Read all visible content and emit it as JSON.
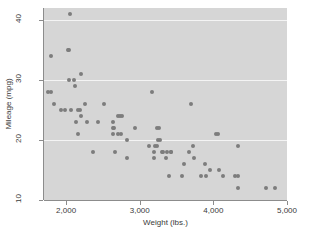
{
  "chart_data": {
    "type": "scatter",
    "title": "",
    "xlabel": "Weight (lbs.)",
    "ylabel": "Mileage (mpg)",
    "xlim": [
      1700,
      5000
    ],
    "ylim": [
      10,
      42
    ],
    "grid": true,
    "legend": null,
    "xticks": [
      {
        "value": 2000,
        "label": "2,000"
      },
      {
        "value": 3000,
        "label": "3,000"
      },
      {
        "value": 4000,
        "label": "4,000"
      },
      {
        "value": 5000,
        "label": "5,000"
      }
    ],
    "yticks": [
      {
        "value": 10,
        "label": "10"
      },
      {
        "value": 20,
        "label": "20"
      },
      {
        "value": 30,
        "label": "30"
      },
      {
        "value": 40,
        "label": "40"
      }
    ],
    "gridlines_y": [
      20,
      30,
      40
    ],
    "marker_color": "#7d7d7d",
    "plot_background": "#d6d6d6",
    "page_background": "#ffffff",
    "points": [
      {
        "x": 2930,
        "y": 22
      },
      {
        "x": 3350,
        "y": 17
      },
      {
        "x": 2640,
        "y": 22
      },
      {
        "x": 3250,
        "y": 20
      },
      {
        "x": 4080,
        "y": 15
      },
      {
        "x": 3670,
        "y": 18
      },
      {
        "x": 3690,
        "y": 26
      },
      {
        "x": 3280,
        "y": 20
      },
      {
        "x": 3880,
        "y": 16
      },
      {
        "x": 4330,
        "y": 19
      },
      {
        "x": 3900,
        "y": 14
      },
      {
        "x": 4290,
        "y": 14
      },
      {
        "x": 4030,
        "y": 21
      },
      {
        "x": 3570,
        "y": 14
      },
      {
        "x": 4130,
        "y": 14
      },
      {
        "x": 4060,
        "y": 21
      },
      {
        "x": 3720,
        "y": 19
      },
      {
        "x": 3420,
        "y": 18
      },
      {
        "x": 3210,
        "y": 19
      },
      {
        "x": 3240,
        "y": 19
      },
      {
        "x": 3130,
        "y": 19
      },
      {
        "x": 3200,
        "y": 18
      },
      {
        "x": 4330,
        "y": 12
      },
      {
        "x": 3370,
        "y": 18
      },
      {
        "x": 4720,
        "y": 12
      },
      {
        "x": 3600,
        "y": 16
      },
      {
        "x": 3740,
        "y": 17
      },
      {
        "x": 3955,
        "y": 15
      },
      {
        "x": 3830,
        "y": 14
      },
      {
        "x": 4840,
        "y": 12
      },
      {
        "x": 4330,
        "y": 14
      },
      {
        "x": 2200,
        "y": 24
      },
      {
        "x": 2520,
        "y": 26
      },
      {
        "x": 2650,
        "y": 22
      },
      {
        "x": 2370,
        "y": 18
      },
      {
        "x": 2750,
        "y": 21
      },
      {
        "x": 2640,
        "y": 21
      },
      {
        "x": 2830,
        "y": 17
      },
      {
        "x": 2710,
        "y": 24
      },
      {
        "x": 2260,
        "y": 26
      },
      {
        "x": 2280,
        "y": 23
      },
      {
        "x": 2120,
        "y": 29
      },
      {
        "x": 2040,
        "y": 35
      },
      {
        "x": 2020,
        "y": 35
      },
      {
        "x": 2050,
        "y": 41
      },
      {
        "x": 1800,
        "y": 34
      },
      {
        "x": 1760,
        "y": 28
      },
      {
        "x": 1800,
        "y": 28
      },
      {
        "x": 1830,
        "y": 26
      },
      {
        "x": 1930,
        "y": 25
      },
      {
        "x": 1990,
        "y": 25
      },
      {
        "x": 2070,
        "y": 25
      },
      {
        "x": 2130,
        "y": 23
      },
      {
        "x": 2190,
        "y": 25
      },
      {
        "x": 2160,
        "y": 21
      },
      {
        "x": 2040,
        "y": 30
      },
      {
        "x": 2110,
        "y": 30
      },
      {
        "x": 2200,
        "y": 31
      },
      {
        "x": 2670,
        "y": 18
      },
      {
        "x": 2640,
        "y": 23
      },
      {
        "x": 2730,
        "y": 24
      },
      {
        "x": 2760,
        "y": 24
      },
      {
        "x": 2700,
        "y": 21
      },
      {
        "x": 2830,
        "y": 20
      },
      {
        "x": 3170,
        "y": 28
      },
      {
        "x": 3230,
        "y": 22
      },
      {
        "x": 3260,
        "y": 22
      },
      {
        "x": 3300,
        "y": 18
      },
      {
        "x": 3310,
        "y": 18
      },
      {
        "x": 3400,
        "y": 14
      },
      {
        "x": 3200,
        "y": 17
      },
      {
        "x": 3430,
        "y": 18
      },
      {
        "x": 2430,
        "y": 23
      },
      {
        "x": 2160,
        "y": 25
      }
    ]
  }
}
